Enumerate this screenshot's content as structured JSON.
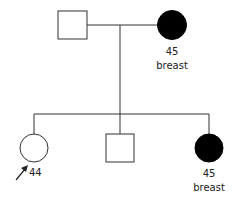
{
  "diagram": {
    "type": "pedigree",
    "colors": {
      "line": "#333333",
      "affected_fill": "#000000",
      "unaffected_fill": "#ffffff"
    },
    "generation1": {
      "father": {
        "sex": "male",
        "affected": false
      },
      "mother": {
        "sex": "female",
        "affected": true,
        "age": "45",
        "condition": "breast"
      }
    },
    "generation2": [
      {
        "sex": "female",
        "affected": false,
        "proband": true,
        "age": "44"
      },
      {
        "sex": "male",
        "affected": false
      },
      {
        "sex": "female",
        "affected": true,
        "age": "45",
        "condition": "breast"
      }
    ]
  }
}
